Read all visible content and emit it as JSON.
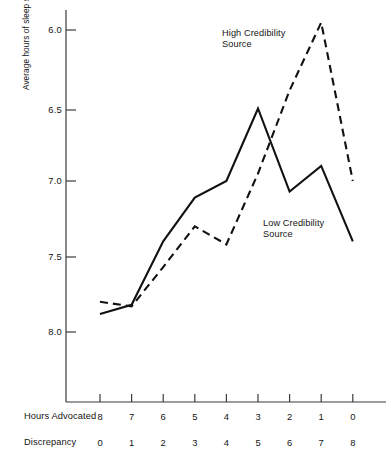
{
  "chart_data": {
    "type": "line",
    "title": "",
    "xlabel": "Hours Advocated",
    "ylabel": "Average hours of sleep subjects believed they needed",
    "grid": false,
    "legend_position": "inline-annotations",
    "y_axis": {
      "inverted": true,
      "ylim": [
        8.25,
        5.85
      ],
      "ticks": [
        6.0,
        6.5,
        7.0,
        7.5,
        8.0
      ],
      "tick_labels": [
        "6.0",
        "6.5",
        "7.0",
        "7.5",
        "8.0"
      ]
    },
    "x_axis": {
      "primary_name": "Hours Advocated",
      "primary_ticks": [
        8,
        7,
        6,
        5,
        4,
        3,
        2,
        1,
        0
      ],
      "primary_tick_labels": [
        "8",
        "7",
        "6",
        "5",
        "4",
        "3",
        "2",
        "1",
        "0"
      ],
      "secondary_name": "Discrepancy",
      "secondary_ticks": [
        0,
        1,
        2,
        3,
        4,
        5,
        6,
        7,
        8
      ],
      "secondary_tick_labels": [
        "0",
        "1",
        "2",
        "3",
        "4",
        "5",
        "6",
        "7",
        "8"
      ]
    },
    "categories": [
      "8",
      "7",
      "6",
      "5",
      "4",
      "3",
      "2",
      "1",
      "0"
    ],
    "series": [
      {
        "name": "High Credibility Source",
        "style": "dashed",
        "color": "#111111",
        "values": [
          7.8,
          7.83,
          7.57,
          7.3,
          7.42,
          6.95,
          6.4,
          5.95,
          7.0
        ]
      },
      {
        "name": "Low Credibility Source",
        "style": "solid",
        "color": "#111111",
        "values": [
          7.88,
          7.82,
          7.4,
          7.11,
          7.0,
          6.52,
          7.07,
          6.9,
          7.4
        ]
      }
    ],
    "annotations": [
      {
        "text_line1": "High Credibility",
        "text_line2": "Source",
        "series": "High Credibility Source"
      },
      {
        "text_line1": "Low Credibility",
        "text_line2": "Source",
        "series": "Low Credibility Source"
      }
    ]
  },
  "axis_labels": {
    "y_ticks": [
      "6.0",
      "6.5",
      "7.0",
      "7.5",
      "8.0"
    ],
    "x_ticks_hours": [
      "8",
      "7",
      "6",
      "5",
      "4",
      "3",
      "2",
      "1",
      "0"
    ],
    "x_ticks_discrepancy": [
      "0",
      "1",
      "2",
      "3",
      "4",
      "5",
      "6",
      "7",
      "8"
    ],
    "row_hours": "Hours Advocated",
    "row_discrepancy": "Discrepancy",
    "y_title": "Average hours of sleep subjects believed they needed"
  },
  "annotations": {
    "high": {
      "line1": "High Credibility",
      "line2": "Source"
    },
    "low": {
      "line1": "Low Credibility",
      "line2": "Source"
    }
  }
}
